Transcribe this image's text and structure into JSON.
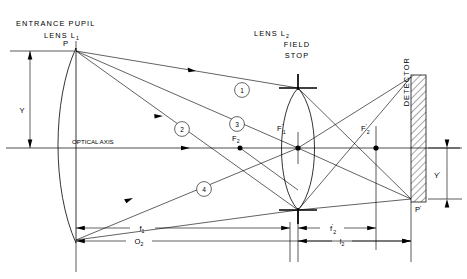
{
  "figure": {
    "type": "optical-ray-diagram",
    "title_labels": {
      "entrance_pupil": "ENTRANCE PUPIL",
      "lens_l1": "LENS L",
      "lens_l1_sub": "1",
      "lens_l2": "LENS L",
      "lens_l2_sub": "2",
      "field": "FIELD",
      "stop": "STOP",
      "detector": "DETECTOR",
      "optical_axis": "OPTICAL  AXIS"
    },
    "points": [
      {
        "name": "P",
        "label": "P",
        "prime": "",
        "sub": ""
      },
      {
        "name": "P-prime",
        "label": "P",
        "prime": "'",
        "sub": ""
      },
      {
        "name": "F2",
        "label": "F",
        "prime": "",
        "sub": "2"
      },
      {
        "name": "F1-prime",
        "label": "F",
        "prime": "'",
        "sub": "1"
      },
      {
        "name": "F2-prime",
        "label": "F",
        "prime": "'",
        "sub": "2"
      }
    ],
    "heights": [
      {
        "name": "Y",
        "label": "Y",
        "prime": ""
      },
      {
        "name": "Y-prime",
        "label": "Y",
        "prime": "'"
      }
    ],
    "dimensions": [
      {
        "name": "f1",
        "label": "f",
        "prime": "",
        "sub": "1"
      },
      {
        "name": "O2",
        "label": "O",
        "prime": "",
        "sub": "2"
      },
      {
        "name": "f2-prime",
        "label": "f",
        "prime": "'",
        "sub": "2"
      },
      {
        "name": "l2",
        "label": "l",
        "prime": "",
        "sub": "2"
      }
    ],
    "rays": [
      {
        "number": "1"
      },
      {
        "number": "2"
      },
      {
        "number": "3"
      },
      {
        "number": "4"
      }
    ],
    "colors": {
      "line": "#000000",
      "background": "#ffffff"
    }
  }
}
